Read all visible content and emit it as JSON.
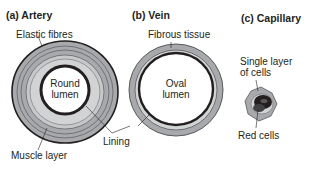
{
  "panels": [
    {
      "title": "(a) Artery",
      "lumen_label": [
        "Round",
        "lumen"
      ],
      "labels": {
        "outer": "Elastic fibres",
        "muscle": "Muscle layer"
      }
    },
    {
      "title": "(b) Vein",
      "lumen_label": [
        "Oval",
        "lumen"
      ],
      "labels": {
        "outer": "Fibrous tissue"
      }
    },
    {
      "title": "(c) Capillary",
      "labels": {
        "wall": [
          "Single layer",
          "of cells"
        ],
        "cells": "Red cells"
      }
    }
  ],
  "shared_labels": {
    "lining": "Lining"
  },
  "colors": {
    "outline": "#231f20",
    "ring_gray": "#a7a9ac",
    "light_gray": "#d1d3d4",
    "lumen": "#ffffff"
  }
}
